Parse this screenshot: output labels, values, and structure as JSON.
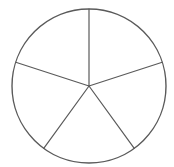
{
  "diagram": {
    "type": "circle-divided-into-equal-sectors",
    "sector_count": 5,
    "center": [
      89,
      86
    ],
    "radius": 77,
    "start_angle_deg": -90,
    "stroke_color": "#5a5a5a",
    "fill_color": "#ffffff",
    "labels": []
  }
}
